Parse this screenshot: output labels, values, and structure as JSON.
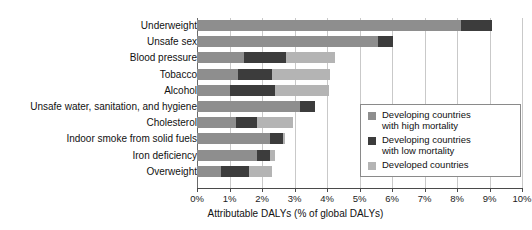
{
  "chart_data": {
    "type": "bar",
    "orientation": "horizontal",
    "stacked": true,
    "title": "",
    "xlabel": "Attributable DALYs (% of global DALYs)",
    "ylabel": "",
    "xlim": [
      0,
      10
    ],
    "xticks": [
      0,
      1,
      2,
      3,
      4,
      5,
      6,
      7,
      8,
      9,
      10
    ],
    "xtick_labels": [
      "0%",
      "1%",
      "2%",
      "3%",
      "4%",
      "5%",
      "6%",
      "7%",
      "8%",
      "9%",
      "10%"
    ],
    "grid": true,
    "legend_position": "center-right",
    "categories": [
      "Underweight",
      "Unsafe sex",
      "Blood pressure",
      "Tobacco",
      "Alcohol",
      "Unsafe water, sanitation, and hygiene",
      "Cholesterol",
      "Indoor smoke from solid fuels",
      "Iron deficiency",
      "Overweight"
    ],
    "series": [
      {
        "name": "Developing countries with high mortality",
        "color": "#8e8e8e",
        "values": [
          8.12,
          5.57,
          1.45,
          1.26,
          1.02,
          3.17,
          1.2,
          2.25,
          1.85,
          0.75
        ]
      },
      {
        "name": "Developing countries with low mortality",
        "color": "#3c3c3c",
        "values": [
          0.96,
          0.46,
          1.29,
          1.05,
          1.38,
          0.46,
          0.65,
          0.4,
          0.4,
          0.85
        ]
      },
      {
        "name": "Developed countries",
        "color": "#b4b4b4",
        "values": [
          0.0,
          0.0,
          1.51,
          1.78,
          1.66,
          0.0,
          1.1,
          0.05,
          0.15,
          0.7
        ]
      }
    ],
    "totals": [
      9.08,
      6.03,
      4.25,
      4.09,
      4.06,
      3.63,
      2.95,
      2.7,
      2.4,
      2.3
    ]
  },
  "legend": {
    "items": [
      {
        "label_line1": "Developing countries",
        "label_line2": "with high mortality",
        "swatch": "high"
      },
      {
        "label_line1": "Developing countries",
        "label_line2": "with low mortality",
        "swatch": "low"
      },
      {
        "label_line1": "Developed countries",
        "label_line2": "",
        "swatch": "dev"
      }
    ]
  }
}
